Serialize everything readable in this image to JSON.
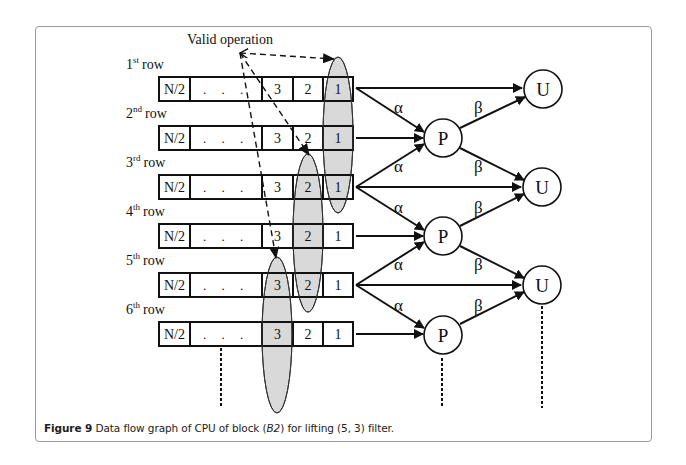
{
  "figure": {
    "label": "Figure 9",
    "caption_pre": " Data flow graph of CPU of block (",
    "caption_italic": "B2",
    "caption_post": ") for lifting (5, 3) filter."
  },
  "diagram": {
    "annotation": "Valid operation",
    "rows": [
      {
        "ordinal": "1",
        "suffix": "st",
        "word": "row",
        "cells": [
          "N/2",
          ". . .",
          "3",
          "2",
          "1"
        ]
      },
      {
        "ordinal": "2",
        "suffix": "nd",
        "word": "row",
        "cells": [
          "N/2",
          ". . .",
          "3",
          "2",
          "1"
        ]
      },
      {
        "ordinal": "3",
        "suffix": "rd",
        "word": "row",
        "cells": [
          "N/2",
          ". . .",
          "3",
          "2",
          "1"
        ]
      },
      {
        "ordinal": "4",
        "suffix": "th",
        "word": "row",
        "cells": [
          "N/2",
          ". . .",
          "3",
          "2",
          "1"
        ]
      },
      {
        "ordinal": "5",
        "suffix": "th",
        "word": "row",
        "cells": [
          "N/2",
          ". . .",
          "3",
          "2",
          "1"
        ]
      },
      {
        "ordinal": "6",
        "suffix": "th",
        "word": "row",
        "cells": [
          "N/2",
          ". . .",
          "3",
          "2",
          "1"
        ]
      }
    ],
    "nodes": {
      "predict": "P",
      "update": "U"
    },
    "weights": {
      "alpha": "α",
      "beta": "β"
    },
    "colors": {
      "highlight": "#d9d9d9",
      "stroke": "#111111",
      "frame": "#9a9a9a"
    }
  }
}
